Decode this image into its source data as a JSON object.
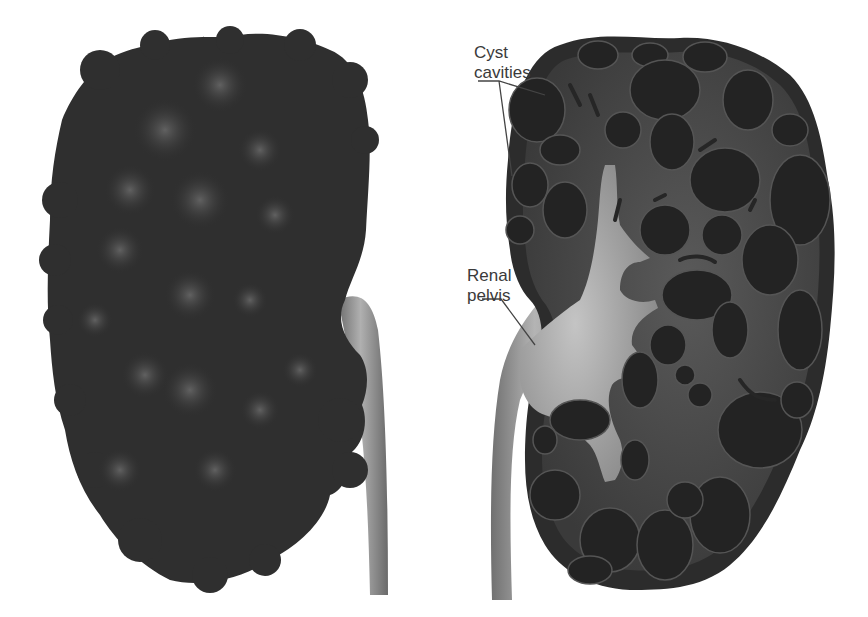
{
  "figure": {
    "panels": [
      {
        "name": "external-view",
        "description": "Exterior of enlarged polycystic kidney with bulging cysts and ureter"
      },
      {
        "name": "cross-section",
        "description": "Sectioned kidney showing numerous cyst cavities and renal pelvis"
      }
    ],
    "labels": {
      "cyst_cavities_line1": "Cyst",
      "cyst_cavities_line2": "cavities",
      "renal_pelvis_line1": "Renal",
      "renal_pelvis_line2": "pelvis"
    },
    "colors": {
      "background": "#ffffff",
      "kidney_dark": "#2e2e2e",
      "kidney_highlight": "#5c5c5c",
      "tissue_mid": "#4a4a4a",
      "cyst": "#262626",
      "pelvis_light": "#b8b8b8",
      "label_text": "#3a3a3a",
      "leader_line": "#444444"
    }
  }
}
